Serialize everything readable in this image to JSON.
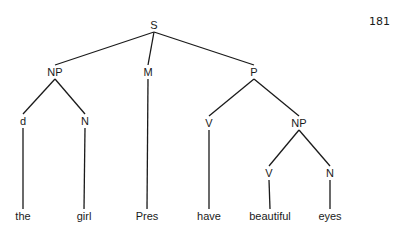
{
  "page_number": "181",
  "tree": {
    "nodes": [
      {
        "id": "S",
        "label": "S",
        "x": 154,
        "y": 25
      },
      {
        "id": "NP1",
        "label": "NP",
        "x": 55,
        "y": 72
      },
      {
        "id": "M",
        "label": "M",
        "x": 148,
        "y": 72
      },
      {
        "id": "P",
        "label": "P",
        "x": 254,
        "y": 72
      },
      {
        "id": "d",
        "label": "d",
        "x": 23,
        "y": 121
      },
      {
        "id": "N1",
        "label": "N",
        "x": 85,
        "y": 121
      },
      {
        "id": "V1",
        "label": "V",
        "x": 209,
        "y": 123
      },
      {
        "id": "NP2",
        "label": "NP",
        "x": 299,
        "y": 123
      },
      {
        "id": "V2",
        "label": "V",
        "x": 269,
        "y": 173
      },
      {
        "id": "N2",
        "label": "N",
        "x": 330,
        "y": 173
      },
      {
        "id": "the",
        "label": "the",
        "x": 23,
        "y": 216
      },
      {
        "id": "girl",
        "label": "girl",
        "x": 84,
        "y": 216
      },
      {
        "id": "Pres",
        "label": "Pres",
        "x": 147,
        "y": 216
      },
      {
        "id": "have",
        "label": "have",
        "x": 209,
        "y": 216
      },
      {
        "id": "beautiful",
        "label": "beautiful",
        "x": 270,
        "y": 216
      },
      {
        "id": "eyes",
        "label": "eyes",
        "x": 330,
        "y": 216
      }
    ],
    "edges": [
      [
        "S",
        "NP1"
      ],
      [
        "S",
        "M"
      ],
      [
        "S",
        "P"
      ],
      [
        "NP1",
        "d"
      ],
      [
        "NP1",
        "N1"
      ],
      [
        "P",
        "V1"
      ],
      [
        "P",
        "NP2"
      ],
      [
        "NP2",
        "V2"
      ],
      [
        "NP2",
        "N2"
      ],
      [
        "d",
        "the"
      ],
      [
        "N1",
        "girl"
      ],
      [
        "M",
        "Pres"
      ],
      [
        "V1",
        "have"
      ],
      [
        "V2",
        "beautiful"
      ],
      [
        "N2",
        "eyes"
      ]
    ]
  },
  "line_color": "#1a1a1a"
}
